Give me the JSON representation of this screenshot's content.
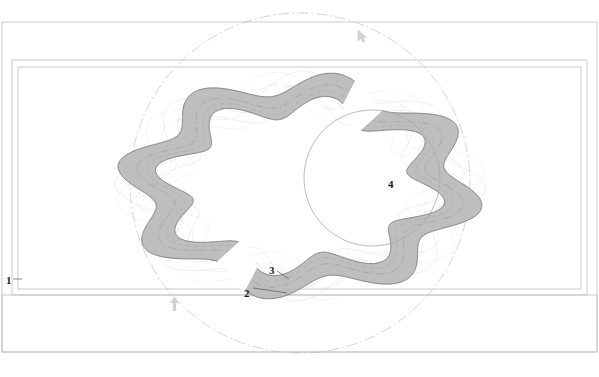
{
  "drawing": {
    "title": "Serpentine Band Ring Assembly Technical Drawing",
    "type": "patent-line-drawing",
    "canvas": {
      "width": 599,
      "height": 377
    },
    "colors": {
      "band_fill": "#b9b9b9",
      "band_stroke": "#6e6e6e",
      "ghost_stroke": "#d9d9d9",
      "frame_stroke": "#bfbfbf",
      "centerline_stroke": "#c9c9c9",
      "dash_stroke": "#c2c2c2",
      "label_color": "#1a1a1a",
      "marker_color": "#d0d0d0",
      "background": "#ffffff"
    },
    "frames": [
      {
        "name": "outer-frame",
        "x": 2,
        "y": 22,
        "w": 595,
        "h": 330
      },
      {
        "name": "middle-frame",
        "x": 12,
        "y": 60,
        "w": 575,
        "h": 235
      },
      {
        "name": "inner-frame",
        "x": 18,
        "y": 67,
        "w": 563,
        "h": 222
      },
      {
        "name": "lower-band-frame",
        "x": 2,
        "y": 295,
        "w": 595,
        "h": 57
      }
    ],
    "central_circle": {
      "name": "hub-circle",
      "cx": 372,
      "cy": 178,
      "r": 68
    },
    "construction_circle": {
      "name": "pitch-circle-chain",
      "cx": 300,
      "cy": 183,
      "r": 170,
      "style": "dash-dot"
    },
    "lobes": 8,
    "labels": [
      {
        "id": "1",
        "text": "1",
        "x": 6,
        "y": 275,
        "target": "outer-frame-edge"
      },
      {
        "id": "2",
        "text": "2",
        "x": 244,
        "y": 288,
        "target": "inner-strand"
      },
      {
        "id": "3",
        "text": "3",
        "x": 269,
        "y": 265,
        "target": "band-segment"
      },
      {
        "id": "4",
        "text": "4",
        "x": 388,
        "y": 179,
        "target": "hub-circle"
      }
    ],
    "leaders": [
      {
        "name": "leader-2",
        "x1": 253,
        "y1": 288,
        "x2": 287,
        "y2": 293
      },
      {
        "name": "leader-3",
        "x1": 277,
        "y1": 271,
        "x2": 289,
        "y2": 279
      },
      {
        "name": "leader-1",
        "x1": 13,
        "y1": 279,
        "x2": 22,
        "y2": 279
      }
    ],
    "markers": [
      {
        "name": "cursor-arrow-marker",
        "x": 358,
        "y": 30,
        "glyph": "cursor",
        "rotation": 0
      },
      {
        "name": "up-arrow-marker",
        "x": 170,
        "y": 297,
        "glyph": "arrow-up",
        "rotation": 0
      }
    ],
    "band": {
      "name": "serpentine-band",
      "outer_radius": 166,
      "inner_radius": 128,
      "amplitude": 19,
      "center": {
        "cx": 300,
        "cy": 186
      },
      "description": "Eight-lobed sinusoidal closed band with open gap segments"
    },
    "ghost_bands": [
      {
        "name": "ghost-band-phase-1",
        "phase": 0.22,
        "opacity": 0.5
      },
      {
        "name": "ghost-band-phase-2",
        "phase": 0.44,
        "opacity": 0.35
      }
    ]
  }
}
